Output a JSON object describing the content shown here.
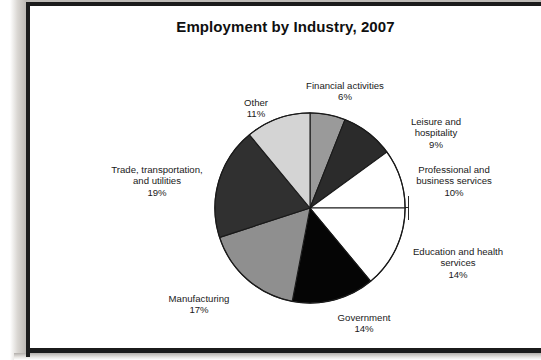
{
  "chart_data": {
    "type": "pie",
    "title": "Employment by Industry, 2007",
    "categories": [
      "Financial activities",
      "Leisure and hospitality",
      "Professional and business services",
      "Education and health services",
      "Government",
      "Manufacturing",
      "Trade, transportation, and utilities",
      "Other"
    ],
    "values": [
      6,
      9,
      10,
      14,
      14,
      17,
      19,
      11
    ],
    "value_labels": [
      "6%",
      "9%",
      "10%",
      "14%",
      "14%",
      "17%",
      "19%",
      "11%"
    ],
    "unit": "%",
    "start_angle_deg": 0,
    "direction": "clockwise",
    "legend": "none",
    "labels_position": "outside",
    "slice_colors": [
      "#9a9a9a",
      "#2b2b2b",
      "#ffffff",
      "#ffffff",
      "#050505",
      "#8f8f8f",
      "#303030",
      "#d4d4d4"
    ],
    "slice_edge_color": "#1a1a1a",
    "xlabel": "",
    "ylabel": "",
    "grid": false
  },
  "labels": {
    "financial": {
      "name": "Financial activities",
      "pct": "6%"
    },
    "leisure": {
      "name": "Leisure and\nhospitality",
      "pct": "9%"
    },
    "professional": {
      "name": "Professional and\nbusiness services",
      "pct": "10%"
    },
    "education": {
      "name": "Education and health\nservices",
      "pct": "14%"
    },
    "government": {
      "name": "Government",
      "pct": "14%"
    },
    "manufacturing": {
      "name": "Manufacturing",
      "pct": "17%"
    },
    "trade": {
      "name": "Trade, transportation,\nand utilities",
      "pct": "19%"
    },
    "other": {
      "name": "Other",
      "pct": "11%"
    }
  },
  "colors": {
    "page_background": "#ffffff",
    "frame_border": "#1b1b1b",
    "text": "#1a1a1a",
    "title_text": "#101010"
  }
}
